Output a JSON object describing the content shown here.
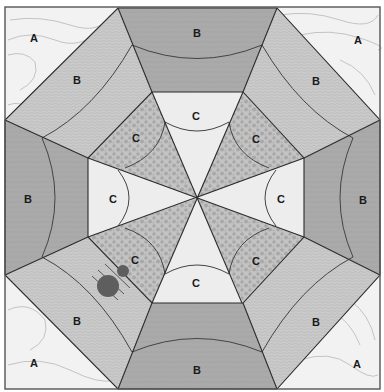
{
  "diagram": {
    "title": "",
    "colors": {
      "A": "#f1f1f1",
      "B_light": "#c9c9c9",
      "B_dark": "#a9a9a9",
      "C_light": "#ececec",
      "C_dot": "#b2b2b2",
      "line": "#2b2b2b",
      "marker": "#5e5e5e"
    },
    "labels": {
      "corner_tl": "A",
      "corner_tr": "A",
      "corner_bl": "A",
      "corner_br": "A",
      "b_top": "B",
      "b_bottom": "B",
      "b_left": "B",
      "b_right": "B",
      "b_diag_tl": "B",
      "b_diag_tr": "B",
      "b_diag_bl": "B",
      "b_diag_br": "B",
      "c_top": "C",
      "c_bottom": "C",
      "c_left": "C",
      "c_right": "C",
      "c_diag_tl": "C",
      "c_diag_tr": "C",
      "c_diag_bl": "C",
      "c_diag_br": "C"
    },
    "regions": [
      {
        "id": "A",
        "description": "Four corner triangles with light topographic-line texture"
      },
      {
        "id": "B",
        "description": "Eight trapezoids of the outer ring; orthogonal ones darker, diagonal ones lighter speckled"
      },
      {
        "id": "C",
        "description": "Eight inner wedges around center; orthogonal ones plain light, diagonal ones dotted"
      }
    ],
    "marker": {
      "description": "Two dark circles with tick lines on lower-left diagonal C/B seam"
    }
  }
}
